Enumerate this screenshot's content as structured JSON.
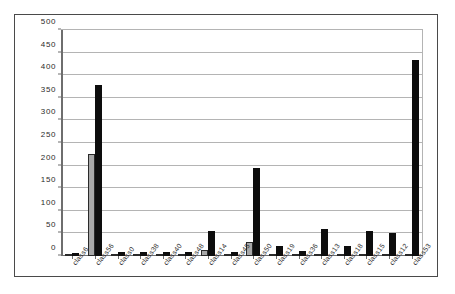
{
  "chart_data": {
    "type": "bar",
    "title": "",
    "subtitle": "",
    "xlabel": "",
    "ylabel": "",
    "ylim": [
      0,
      500
    ],
    "ytick_step": 50,
    "yticks": [
      "500",
      "450",
      "400",
      "350",
      "300",
      "250",
      "200",
      "150",
      "100",
      "50",
      "0"
    ],
    "grid": true,
    "legend": "none",
    "xlabel_rotation_deg": -52,
    "categories": [
      "class6",
      "class56",
      "class0",
      "class38",
      "class40",
      "class48",
      "class14",
      "class45",
      "class50",
      "class19",
      "class36",
      "class13",
      "class18",
      "class15",
      "class12",
      "class53"
    ],
    "series": [
      {
        "name": "series-1",
        "color": "#a8a8a8",
        "values": [
          3,
          225,
          2,
          3,
          3,
          2,
          13,
          3,
          30,
          2,
          1,
          2,
          3,
          2,
          2,
          2
        ]
      },
      {
        "name": "series-2",
        "color": "#0d0d0d",
        "values": [
          7,
          378,
          8,
          9,
          9,
          8,
          55,
          8,
          195,
          22,
          11,
          60,
          22,
          55,
          50,
          433
        ]
      }
    ]
  },
  "frame": {
    "border_color": "#4a4a4a",
    "gridline_color": "#b4b4b4",
    "axis_color": "#6e6e6e",
    "background": "#ffffff"
  }
}
